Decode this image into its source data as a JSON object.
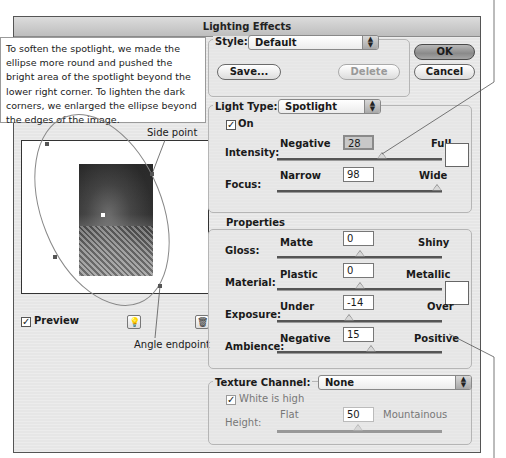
{
  "dialog": {
    "title": "Lighting Effects",
    "ok_label": "OK",
    "cancel_label": "Cancel"
  },
  "annotation": {
    "callout_text": "To soften the spotlight, we made the ellipse more round and pushed the bright area of the spotlight beyond the lower right corner. To lighten the dark corners, we enlarged the ellipse beyond the edges of the image.",
    "side_point_label": "Side point",
    "angle_endpoint_label": "Angle endpoint"
  },
  "preview": {
    "checkbox_label": "Preview",
    "checked": true,
    "light_bulb_icon": "light-bulb-icon",
    "trash_icon": "trash-icon"
  },
  "style": {
    "label": "Style:",
    "value": "Default",
    "save_label": "Save...",
    "delete_label": "Delete"
  },
  "light_type": {
    "label": "Light Type:",
    "value": "Spotlight",
    "on_label": "On",
    "on_checked": true,
    "intensity": {
      "label": "Intensity:",
      "min_label": "Negative",
      "max_label": "Full",
      "value": "28",
      "thumb_pct": 63
    },
    "focus": {
      "label": "Focus:",
      "min_label": "Narrow",
      "max_label": "Wide",
      "value": "98",
      "thumb_pct": 99
    }
  },
  "properties": {
    "title": "Properties",
    "gloss": {
      "label": "Gloss:",
      "min_label": "Matte",
      "max_label": "Shiny",
      "value": "0",
      "thumb_pct": 50
    },
    "material": {
      "label": "Material:",
      "min_label": "Plastic",
      "max_label": "Metallic",
      "value": "0",
      "thumb_pct": 50
    },
    "exposure": {
      "label": "Exposure:",
      "min_label": "Under",
      "max_label": "Over",
      "value": "-14",
      "thumb_pct": 43
    },
    "ambience": {
      "label": "Ambience:",
      "min_label": "Negative",
      "max_label": "Positive",
      "value": "15",
      "thumb_pct": 57
    }
  },
  "texture": {
    "label": "Texture Channel:",
    "value": "None",
    "white_is_high_label": "White is high",
    "white_is_high_checked": true,
    "height": {
      "label": "Height:",
      "min_label": "Flat",
      "max_label": "Mountainous",
      "value": "50",
      "thumb_pct": 50
    }
  }
}
